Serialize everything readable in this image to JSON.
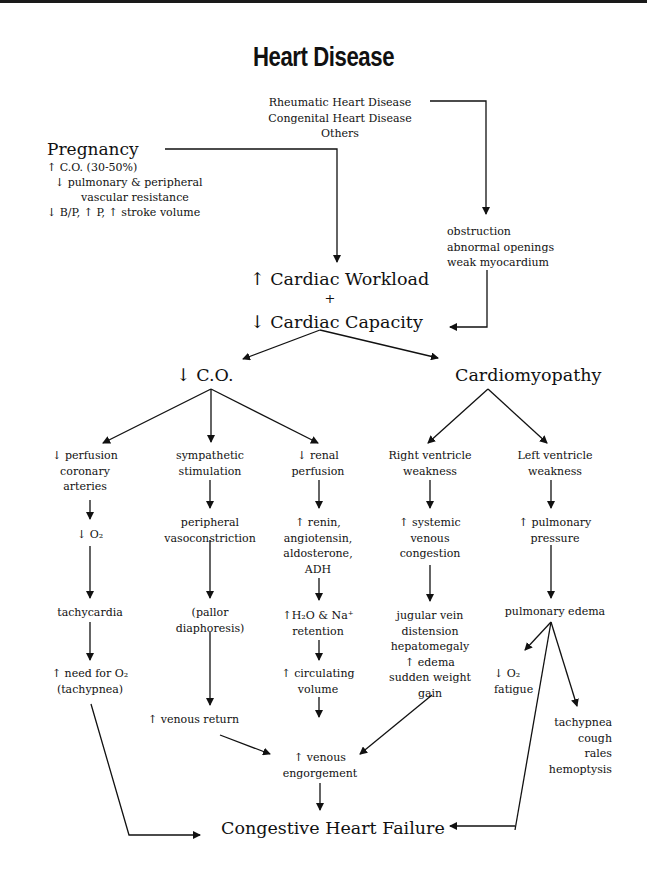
{
  "title": "Heart Disease",
  "causes_top": {
    "lines": [
      "Rheumatic Heart Disease",
      "Congenital Heart Disease",
      "Others"
    ]
  },
  "pregnancy": {
    "heading": "Pregnancy",
    "lines": [
      "↑ C.O. (30-50%)",
      "↓ pulmonary & peripheral",
      "vascular resistance",
      "↓ B/P, ↑ P, ↑ stroke volume"
    ]
  },
  "structural": {
    "lines": [
      "obstruction",
      "abnormal openings",
      "weak myocardium"
    ]
  },
  "central": {
    "workload": "↑ Cardiac Workload",
    "plus": "+",
    "capacity": "↓ Cardiac Capacity"
  },
  "branches": {
    "co": "↓ C.O.",
    "cardiomyopathy": "Cardiomyopathy"
  },
  "col_perfusion": {
    "head": [
      "↓ perfusion",
      "coronary",
      "arteries"
    ],
    "o2": "↓ O₂",
    "tachycardia": "tachycardia",
    "need": [
      "↑ need for O₂",
      "(tachypnea)"
    ]
  },
  "col_sympathetic": {
    "head": [
      "sympathetic",
      "stimulation"
    ],
    "vaso": [
      "peripheral",
      "vasoconstriction"
    ],
    "pallor": [
      "(pallor",
      "diaphoresis)"
    ],
    "return": "↑ venous return"
  },
  "col_renal": {
    "head": [
      "↓ renal",
      "perfusion"
    ],
    "renin": [
      "↑ renin,",
      "angiotensin,",
      "aldosterone,",
      "ADH"
    ],
    "retention": [
      "↑H₂O & Na⁺",
      "retention"
    ],
    "volume": [
      "↑ circulating",
      "volume"
    ]
  },
  "col_right": {
    "head": [
      "Right ventricle",
      "weakness"
    ],
    "congestion": [
      "↑ systemic",
      "venous",
      "congestion"
    ],
    "signs": [
      "jugular vein",
      "distension",
      "hepatomegaly",
      "↑ edema",
      "sudden weight",
      "gain"
    ]
  },
  "col_left": {
    "head": [
      "Left ventricle",
      "weakness"
    ],
    "pressure": [
      "↑ pulmonary",
      "pressure"
    ],
    "edema": "pulmonary edema",
    "o2fatigue": [
      "↓ O₂",
      "fatigue"
    ],
    "resp": [
      "tachypnea",
      "cough",
      "rales",
      "hemoptysis"
    ]
  },
  "engorgement": [
    "↑ venous",
    "engorgement"
  ],
  "outcome": "Congestive Heart Failure",
  "colors": {
    "ink": "#111111",
    "background": "#ffffff"
  }
}
